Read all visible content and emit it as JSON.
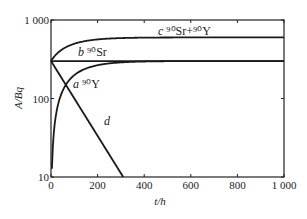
{
  "chart_data": {
    "type": "line",
    "title": "",
    "xlabel": "t/h",
    "ylabel": "A/Bq",
    "xlim": [
      0,
      1000
    ],
    "ylim": [
      10,
      1000
    ],
    "yscale": "log",
    "xticks": [
      "0",
      "200",
      "400",
      "600",
      "800",
      "1 000"
    ],
    "yticks": [
      "10",
      "100",
      "1 000"
    ],
    "grid": false,
    "legend": "inline labels",
    "series": [
      {
        "name": "a 90Y",
        "label_letter": "a",
        "label_text": "⁹⁰Y",
        "x": [
          0,
          20,
          50,
          100,
          200,
          300,
          400,
          600,
          1000
        ],
        "values": [
          0,
          47,
          95,
          155,
          234,
          270,
          285,
          297,
          300
        ]
      },
      {
        "name": "b 90Sr",
        "label_letter": "b",
        "label_text": "⁹⁰Sr",
        "x": [
          0,
          1000
        ],
        "values": [
          300,
          300
        ]
      },
      {
        "name": "c 90Sr+90Y",
        "label_letter": "c",
        "label_text": "⁹⁰Sr+⁹⁰Y",
        "x": [
          0,
          20,
          50,
          100,
          200,
          300,
          400,
          600,
          1000
        ],
        "values": [
          300,
          347,
          395,
          455,
          534,
          570,
          585,
          597,
          600
        ]
      },
      {
        "name": "d",
        "label_letter": "d",
        "label_text": "",
        "x": [
          0,
          310
        ],
        "values": [
          300,
          10
        ]
      }
    ]
  }
}
